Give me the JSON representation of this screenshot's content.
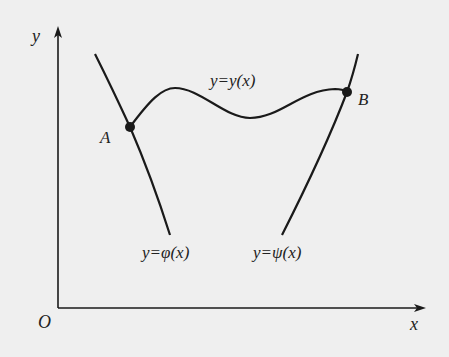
{
  "figure": {
    "background": "#efefef",
    "line_color": "#1a1a1a",
    "axes": {
      "x_label": "x",
      "y_label": "y",
      "origin_label": "O"
    },
    "curves": [
      {
        "id": "phi",
        "label": "y=φ(x)"
      },
      {
        "id": "y",
        "label": "y=y(x)"
      },
      {
        "id": "psi",
        "label": "y=ψ(x)"
      }
    ],
    "points": [
      {
        "id": "A",
        "label": "A"
      },
      {
        "id": "B",
        "label": "B"
      }
    ]
  }
}
